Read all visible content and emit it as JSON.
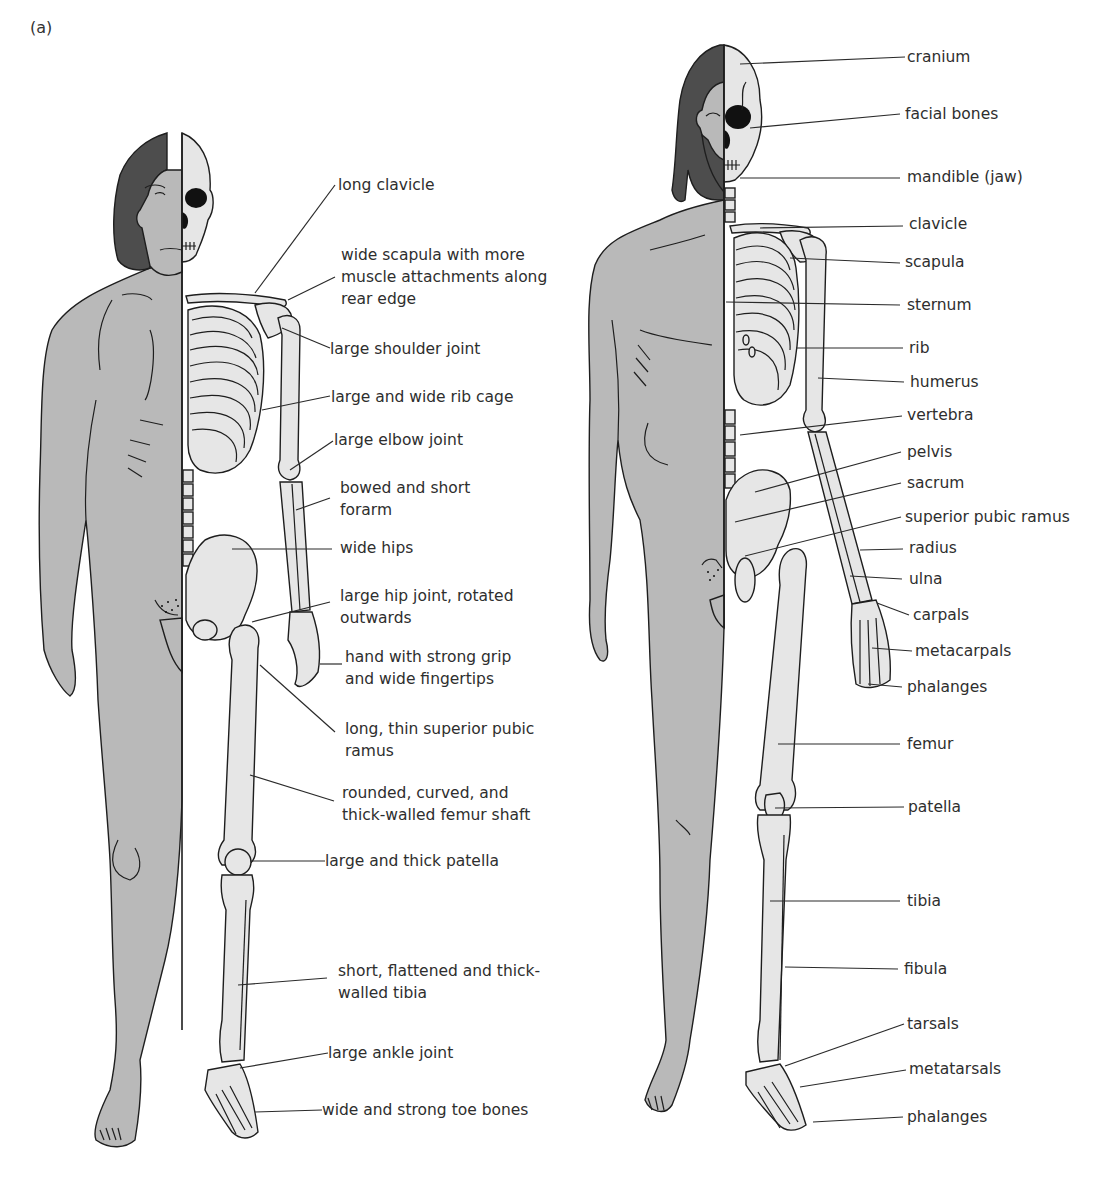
{
  "figure": {
    "panel_label": "(a)",
    "colors": {
      "skin": "#b9b9b9",
      "hair": "#4d4d4d",
      "bone": "#e6e6e6",
      "line": "#1e1e1e",
      "text": "#2e2e2e"
    }
  },
  "left_figure": {
    "title": "Neanderthal skeleton comparison",
    "labels": [
      {
        "id": "long-clavicle",
        "lines": [
          "long clavicle"
        ]
      },
      {
        "id": "wide-scapula",
        "lines": [
          "wide scapula with more",
          "muscle attachments along",
          "rear edge"
        ]
      },
      {
        "id": "large-shoulder-joint",
        "lines": [
          "large shoulder joint"
        ]
      },
      {
        "id": "large-wide-rib-cage",
        "lines": [
          "large and wide rib cage"
        ]
      },
      {
        "id": "large-elbow-joint",
        "lines": [
          "large elbow joint"
        ]
      },
      {
        "id": "bowed-short-forarm",
        "lines": [
          "bowed and short",
          "forarm"
        ]
      },
      {
        "id": "wide-hips",
        "lines": [
          "wide hips"
        ]
      },
      {
        "id": "large-hip-joint",
        "lines": [
          "large hip joint, rotated",
          "outwards"
        ]
      },
      {
        "id": "hand-strong-grip",
        "lines": [
          "hand with strong grip",
          "and wide fingertips"
        ]
      },
      {
        "id": "long-thin-pubic-ramus",
        "lines": [
          "long, thin superior pubic",
          "ramus"
        ]
      },
      {
        "id": "femur-shaft",
        "lines": [
          "rounded, curved, and",
          "thick-walled femur shaft"
        ]
      },
      {
        "id": "large-thick-patella",
        "lines": [
          "large and thick patella"
        ]
      },
      {
        "id": "short-tibia",
        "lines": [
          "short, flattened and thick-",
          "walled tibia"
        ]
      },
      {
        "id": "large-ankle-joint",
        "lines": [
          "large ankle joint"
        ]
      },
      {
        "id": "wide-toe-bones",
        "lines": [
          "wide and strong toe bones"
        ]
      }
    ]
  },
  "right_figure": {
    "title": "Modern human skeleton",
    "labels": [
      {
        "id": "cranium",
        "lines": [
          "cranium"
        ]
      },
      {
        "id": "facial-bones",
        "lines": [
          "facial bones"
        ]
      },
      {
        "id": "mandible",
        "lines": [
          "mandible (jaw)"
        ]
      },
      {
        "id": "clavicle",
        "lines": [
          "clavicle"
        ]
      },
      {
        "id": "scapula",
        "lines": [
          "scapula"
        ]
      },
      {
        "id": "sternum",
        "lines": [
          "sternum"
        ]
      },
      {
        "id": "rib",
        "lines": [
          "rib"
        ]
      },
      {
        "id": "humerus",
        "lines": [
          "humerus"
        ]
      },
      {
        "id": "vertebra",
        "lines": [
          "vertebra"
        ]
      },
      {
        "id": "pelvis",
        "lines": [
          "pelvis"
        ]
      },
      {
        "id": "sacrum",
        "lines": [
          "sacrum"
        ]
      },
      {
        "id": "superior-pubic-ramus",
        "lines": [
          "superior pubic ramus"
        ]
      },
      {
        "id": "radius",
        "lines": [
          "radius"
        ]
      },
      {
        "id": "ulna",
        "lines": [
          "ulna"
        ]
      },
      {
        "id": "carpals",
        "lines": [
          "carpals"
        ]
      },
      {
        "id": "metacarpals",
        "lines": [
          "metacarpals"
        ]
      },
      {
        "id": "phalanges-hand",
        "lines": [
          "phalanges"
        ]
      },
      {
        "id": "femur",
        "lines": [
          "femur"
        ]
      },
      {
        "id": "patella",
        "lines": [
          "patella"
        ]
      },
      {
        "id": "tibia",
        "lines": [
          "tibia"
        ]
      },
      {
        "id": "fibula",
        "lines": [
          "fibula"
        ]
      },
      {
        "id": "tarsals",
        "lines": [
          "tarsals"
        ]
      },
      {
        "id": "metatarsals",
        "lines": [
          "metatarsals"
        ]
      },
      {
        "id": "phalanges-foot",
        "lines": [
          "phalanges"
        ]
      }
    ]
  }
}
